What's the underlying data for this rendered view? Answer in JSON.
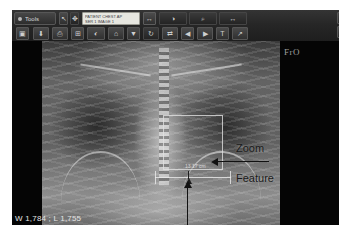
{
  "app": {
    "name": "dicom-viewer"
  },
  "toolbar": {
    "menu_button_label": "Tools",
    "patient_field": {
      "line1": "PATIENT  CHEST  AP",
      "line2": "SER 1  IMAGE 1"
    },
    "field_button_icon": "list-icon",
    "row1_buttons": [
      {
        "icon": "cursor-icon",
        "glyph": "↖"
      },
      {
        "icon": "pan-icon",
        "glyph": "✥"
      },
      {
        "icon": "window-level-icon",
        "glyph": "◑"
      },
      {
        "icon": "zoom-icon",
        "glyph": "⌕"
      },
      {
        "icon": "measure-icon",
        "glyph": "↔"
      }
    ],
    "row2_buttons": [
      {
        "icon": "open-icon",
        "glyph": "▣"
      },
      {
        "icon": "save-icon",
        "glyph": "⬇"
      },
      {
        "icon": "print-icon",
        "glyph": "⎙"
      },
      {
        "icon": "layout-icon",
        "glyph": "⊞"
      },
      {
        "icon": "invert-icon",
        "glyph": "◐"
      },
      {
        "icon": "home-icon",
        "glyph": "⌂"
      },
      {
        "icon": "chevron-down-icon",
        "glyph": "▼"
      },
      {
        "icon": "rotate-icon",
        "glyph": "↻"
      },
      {
        "icon": "flip-icon",
        "glyph": "⇄"
      },
      {
        "icon": "prev-icon",
        "glyph": "◀"
      },
      {
        "icon": "next-icon",
        "glyph": "▶"
      },
      {
        "icon": "text-icon",
        "glyph": "T"
      },
      {
        "icon": "arrow-tool-icon",
        "glyph": "↗"
      }
    ],
    "right_buttons_row1": [
      {
        "icon": "crosshair-icon",
        "glyph": "⌖"
      },
      {
        "icon": "grid-icon",
        "glyph": "⊞"
      },
      {
        "icon": "square-icon",
        "glyph": "□"
      },
      {
        "icon": "export-icon",
        "glyph": "⤒"
      }
    ],
    "right_buttons_row2": [
      {
        "icon": "list-icon",
        "glyph": "≡"
      },
      {
        "icon": "pen-icon",
        "glyph": "✐"
      },
      {
        "icon": "magnifier-icon",
        "glyph": "⚫"
      },
      {
        "icon": "undo-icon",
        "glyph": "↺"
      }
    ]
  },
  "image": {
    "modality_marker": "FrO",
    "window_level_readout": "W 1,784 ; L 1,755",
    "caliper_value": "13.17 cm"
  },
  "annotations": {
    "zoom_label": "Zoom",
    "feature_label": "Feature",
    "markup_label": "Markup Caliper"
  },
  "colors": {
    "toolbar_bg": "#2b2b2b",
    "viewport_bg": "#050505",
    "annotation_text": "#1a1a1a",
    "overlay_text": "#e4e4e4"
  }
}
